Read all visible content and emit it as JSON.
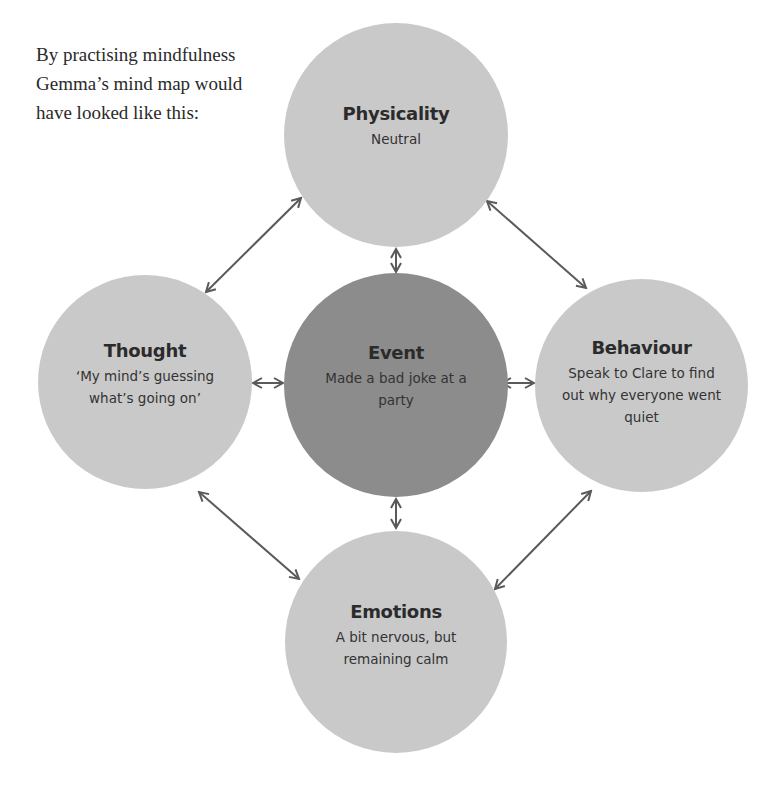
{
  "intro_text": "By practising mindfulness Gemma’s mind map would have looked like this:",
  "colors": {
    "outer_node": "#c9c9c9",
    "center_node": "#8c8c8c",
    "arrow": "#5a5a5a",
    "text": "#2b2b2b"
  },
  "nodes": {
    "physicality": {
      "title": "Physicality",
      "desc": "Neutral"
    },
    "thought": {
      "title": "Thought",
      "desc": "‘My mind’s guessing what’s going on’"
    },
    "event": {
      "title": "Event",
      "desc": "Made a bad joke at a party"
    },
    "behaviour": {
      "title": "Behaviour",
      "desc": "Speak to Clare to find out why everyone went quiet"
    },
    "emotions": {
      "title": "Emotions",
      "desc": "A bit nervous, but remaining calm"
    }
  },
  "connections": [
    {
      "from": "event",
      "to": "physicality",
      "type": "bidirectional"
    },
    {
      "from": "event",
      "to": "thought",
      "type": "bidirectional"
    },
    {
      "from": "event",
      "to": "behaviour",
      "type": "bidirectional"
    },
    {
      "from": "event",
      "to": "emotions",
      "type": "bidirectional"
    },
    {
      "from": "physicality",
      "to": "thought",
      "type": "bidirectional"
    },
    {
      "from": "physicality",
      "to": "behaviour",
      "type": "bidirectional"
    },
    {
      "from": "thought",
      "to": "emotions",
      "type": "bidirectional"
    },
    {
      "from": "behaviour",
      "to": "emotions",
      "type": "bidirectional"
    }
  ]
}
